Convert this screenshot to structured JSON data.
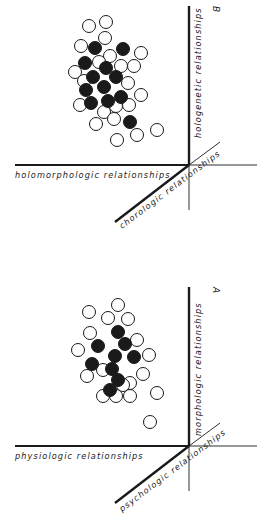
{
  "panels": [
    {
      "id": "B",
      "letter": "B",
      "axes": {
        "vertical_label": "hologenetic relationships",
        "horizontal_label": "holomorphologic relationships",
        "diagonal_label": "chorologic relationships"
      },
      "origin": [
        188,
        165
      ],
      "open_circles": [
        [
          89,
          26
        ],
        [
          106,
          22
        ],
        [
          105,
          38
        ],
        [
          81,
          46
        ],
        [
          110,
          56
        ],
        [
          141,
          53
        ],
        [
          99,
          62
        ],
        [
          121,
          66
        ],
        [
          134,
          66
        ],
        [
          75,
          72
        ],
        [
          84,
          81
        ],
        [
          128,
          83
        ],
        [
          141,
          95
        ],
        [
          80,
          105
        ],
        [
          116,
          106
        ],
        [
          129,
          105
        ],
        [
          104,
          112
        ],
        [
          96,
          124
        ],
        [
          114,
          119
        ],
        [
          137,
          135
        ],
        [
          157,
          130
        ],
        [
          117,
          140
        ]
      ],
      "filled_circles": [
        [
          95,
          48
        ],
        [
          123,
          49
        ],
        [
          85,
          63
        ],
        [
          106,
          68
        ],
        [
          93,
          77
        ],
        [
          116,
          77
        ],
        [
          86,
          90
        ],
        [
          104,
          87
        ],
        [
          121,
          97
        ],
        [
          91,
          103
        ],
        [
          108,
          101
        ],
        [
          130,
          122
        ]
      ]
    },
    {
      "id": "A",
      "letter": "A",
      "axes": {
        "vertical_label": "morphologic relationships",
        "horizontal_label": "physiologic relationships",
        "diagonal_label": "psychologic relationships"
      },
      "origin": [
        188,
        446
      ],
      "open_circles": [
        [
          118,
          305
        ],
        [
          89,
          312
        ],
        [
          108,
          318
        ],
        [
          128,
          319
        ],
        [
          90,
          333
        ],
        [
          78,
          350
        ],
        [
          137,
          340
        ],
        [
          149,
          355
        ],
        [
          87,
          376
        ],
        [
          103,
          370
        ],
        [
          143,
          374
        ],
        [
          130,
          383
        ],
        [
          123,
          385
        ],
        [
          103,
          396
        ],
        [
          116,
          396
        ],
        [
          130,
          396
        ],
        [
          157,
          393
        ],
        [
          150,
          422
        ]
      ],
      "filled_circles": [
        [
          118,
          332
        ],
        [
          98,
          346
        ],
        [
          125,
          344
        ],
        [
          115,
          356
        ],
        [
          134,
          357
        ],
        [
          92,
          364
        ],
        [
          112,
          369
        ],
        [
          118,
          380
        ],
        [
          110,
          390
        ]
      ]
    }
  ],
  "style": {
    "ink": "#1a1a1a",
    "background": "#ffffff",
    "circle_radius": 6.5
  }
}
